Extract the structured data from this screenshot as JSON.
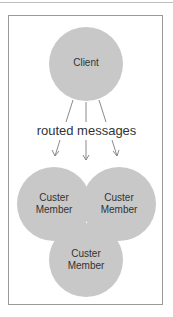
{
  "diagram": {
    "client": {
      "label": "Client"
    },
    "edge_label": "routed messages",
    "members": [
      {
        "line1": "Custer",
        "line2": "Member"
      },
      {
        "line1": "Custer",
        "line2": "Member"
      },
      {
        "line1": "Custer",
        "line2": "Member"
      }
    ],
    "colors": {
      "node_fill": "#c8c8c8",
      "frame": "#9a9a9a",
      "arrow": "#8a8a8a"
    }
  }
}
